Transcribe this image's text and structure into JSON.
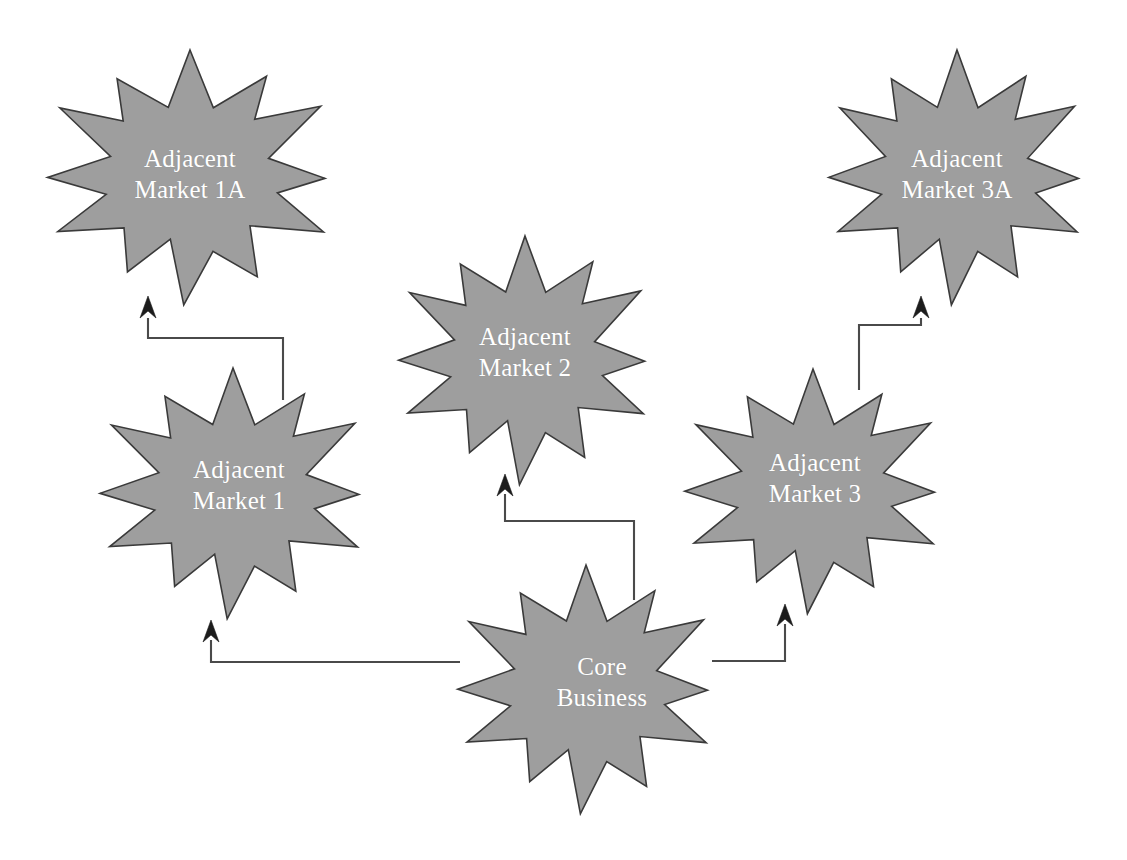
{
  "diagram": {
    "background_color": "#ffffff",
    "star_fill_color": "#9e9e9e",
    "star_outline_color": "#3a3a3a",
    "label_color": "#ffffff",
    "connector_color": "#4a4a4a",
    "nodes": [
      {
        "id": "adjacent-market-1a",
        "line1": "Adjacent",
        "line2": "Market 1A",
        "cx": 190,
        "cy": 175,
        "rx": 150,
        "ry": 125,
        "label_x": 190,
        "label_y": 174
      },
      {
        "id": "adjacent-market-3a",
        "line1": "Adjacent",
        "line2": "Market 3A",
        "cx": 957,
        "cy": 175,
        "rx": 135,
        "ry": 125,
        "label_x": 957,
        "label_y": 174
      },
      {
        "id": "adjacent-market-2",
        "line1": "Adjacent",
        "line2": "Market 2",
        "cx": 525,
        "cy": 358,
        "rx": 133,
        "ry": 122,
        "label_x": 525,
        "label_y": 352
      },
      {
        "id": "adjacent-market-1",
        "line1": "Adjacent",
        "line2": "Market 1",
        "cx": 233,
        "cy": 491,
        "rx": 140,
        "ry": 123,
        "label_x": 239,
        "label_y": 485
      },
      {
        "id": "adjacent-market-3",
        "line1": "Adjacent",
        "line2": "Market 3",
        "cx": 813,
        "cy": 489,
        "rx": 135,
        "ry": 120,
        "label_x": 815,
        "label_y": 478
      },
      {
        "id": "core-business",
        "line1": "Core",
        "line2": "Business",
        "cx": 586,
        "cy": 687,
        "rx": 135,
        "ry": 122,
        "label_x": 602,
        "label_y": 682
      }
    ],
    "connectors": [
      {
        "id": "core-to-market-1",
        "from": "core-business",
        "to": "adjacent-market-1",
        "path": "M 460 662 L 211 662 L 211 640",
        "arrow_x": 211,
        "arrow_y": 620,
        "arrow_dir": "up"
      },
      {
        "id": "core-to-market-2",
        "from": "core-business",
        "to": "adjacent-market-2",
        "path": "M 634 600 L 634 521 L 505 521 L 505 494",
        "arrow_x": 505,
        "arrow_y": 474,
        "arrow_dir": "up"
      },
      {
        "id": "core-to-market-3",
        "from": "core-business",
        "to": "adjacent-market-3",
        "path": "M 712 661 L 785 661 L 785 624",
        "arrow_x": 785,
        "arrow_y": 604,
        "arrow_dir": "up"
      },
      {
        "id": "market-1-to-market-1a",
        "from": "adjacent-market-1",
        "to": "adjacent-market-1a",
        "path": "M 283 400 L 283 338 L 148 338 L 148 318",
        "arrow_x": 148,
        "arrow_y": 296,
        "arrow_dir": "up"
      },
      {
        "id": "market-3-to-market-3a",
        "from": "adjacent-market-3",
        "to": "adjacent-market-3a",
        "path": "M 859 390 L 859 325 L 921 325 L 921 318",
        "arrow_x": 921,
        "arrow_y": 296,
        "arrow_dir": "up"
      }
    ]
  }
}
